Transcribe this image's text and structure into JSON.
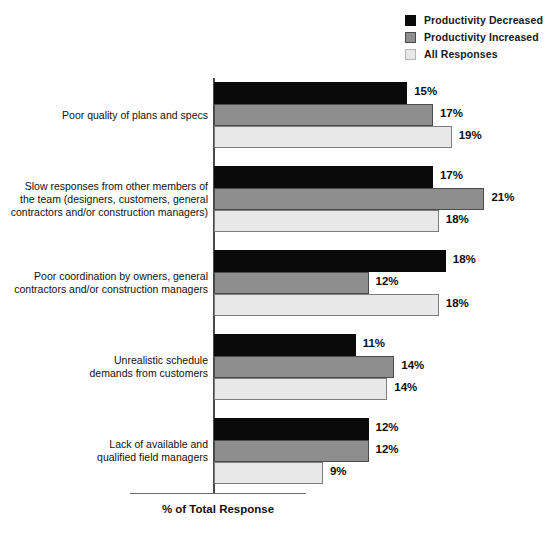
{
  "chart_data": {
    "type": "bar",
    "orientation": "horizontal",
    "title": "",
    "xlabel": "% of Total Response",
    "ylabel": "",
    "xlim": [
      0,
      22
    ],
    "grid": false,
    "legend_position": "top-right",
    "value_suffix": "%",
    "categories": [
      "Poor quality of plans and specs",
      "Slow responses from other members of\nthe team (designers, customers, general\ncontractors and/or construction managers)",
      "Poor coordination by owners, general\ncontractors and/or construction managers",
      "Unrealistic schedule\ndemands from customers",
      "Lack of available and\nqualified field managers"
    ],
    "series": [
      {
        "name": "Productivity Decreased",
        "color": "#0a0a0a",
        "values": [
          15,
          17,
          18,
          11,
          12
        ],
        "labels": [
          "15%",
          "17%",
          "18%",
          "11%",
          "12%"
        ]
      },
      {
        "name": "Productivity Increased",
        "color": "#8e8e8e",
        "values": [
          17,
          21,
          12,
          14,
          12
        ],
        "labels": [
          "17%",
          "21%",
          "12%",
          "14%",
          "12%"
        ]
      },
      {
        "name": "All Responses",
        "color": "#e8e8e8",
        "values": [
          19,
          18,
          18,
          14,
          9
        ],
        "labels": [
          "19%",
          "18%",
          "18%",
          "14%",
          "9%"
        ]
      }
    ]
  },
  "legend": {
    "items": [
      {
        "label": "Productivity Decreased",
        "color": "#0a0a0a",
        "border": "#0a0a0a"
      },
      {
        "label": "Productivity Increased",
        "color": "#8e8e8e",
        "border": "#4b4b4b"
      },
      {
        "label": "All Responses",
        "color": "#e8e8e8",
        "border": "#b5b5b5"
      }
    ]
  },
  "axis": {
    "x_title": "% of Total Response"
  }
}
